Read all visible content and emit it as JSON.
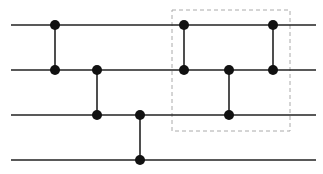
{
  "diagram": {
    "type": "quantum-circuit",
    "wires": [
      {
        "index": 0,
        "y": 25
      },
      {
        "index": 1,
        "y": 70
      },
      {
        "index": 2,
        "y": 115
      },
      {
        "index": 3,
        "y": 160
      }
    ],
    "wire_x_start": 11,
    "wire_x_end": 316,
    "gates": [
      {
        "x": 55,
        "from": 0,
        "to": 1
      },
      {
        "x": 97,
        "from": 1,
        "to": 2
      },
      {
        "x": 140,
        "from": 2,
        "to": 3
      },
      {
        "x": 184,
        "from": 0,
        "to": 1
      },
      {
        "x": 229,
        "from": 1,
        "to": 2
      },
      {
        "x": 273,
        "from": 0,
        "to": 1
      }
    ],
    "highlight_box": {
      "x": 172,
      "y": 10,
      "width": 118,
      "height": 121,
      "style": "dashed"
    },
    "colors": {
      "wire": "#222222",
      "dot": "#111111",
      "box": "#aaaaaa"
    }
  }
}
